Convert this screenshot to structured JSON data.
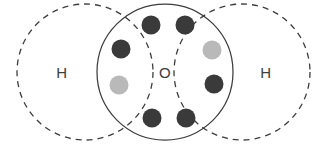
{
  "diagram": {
    "type": "venn-overlap-electron-shell",
    "canvas": {
      "width": 324,
      "height": 144,
      "background": "#ffffff"
    },
    "colors": {
      "outline": "#3d3d3d",
      "electron_dark": "#3a3a3a",
      "electron_light": "#b9b9b9",
      "label": "#3d3d3d",
      "background": "#ffffff"
    },
    "shells": [
      {
        "id": "shell-hydrogen-left",
        "element_label": "H",
        "style": "dashed",
        "cx": 85,
        "cy": 72,
        "r": 68,
        "label_x": 62,
        "label_y": 72
      },
      {
        "id": "shell-oxygen-center",
        "element_label": "O",
        "style": "solid",
        "cx": 165,
        "cy": 72,
        "r": 68,
        "label_x": 165,
        "label_y": 72
      },
      {
        "id": "shell-hydrogen-right",
        "element_label": "H",
        "style": "dashed",
        "cx": 242,
        "cy": 72,
        "r": 68,
        "label_x": 266,
        "label_y": 72
      }
    ],
    "electrons": [
      {
        "id": "electron-top-left",
        "cx": 151,
        "cy": 25,
        "r": 9.5,
        "shade": "dark",
        "shade_hex": "#3a3a3a"
      },
      {
        "id": "electron-top-right",
        "cx": 185,
        "cy": 25,
        "r": 9.5,
        "shade": "dark",
        "shade_hex": "#3a3a3a"
      },
      {
        "id": "electron-upper-left-bond",
        "cx": 121,
        "cy": 49,
        "r": 9.5,
        "shade": "dark",
        "shade_hex": "#3a3a3a"
      },
      {
        "id": "electron-lower-left-bond",
        "cx": 119,
        "cy": 85,
        "r": 9.5,
        "shade": "light",
        "shade_hex": "#b9b9b9"
      },
      {
        "id": "electron-upper-right-bond",
        "cx": 212,
        "cy": 50,
        "r": 9.5,
        "shade": "light",
        "shade_hex": "#b9b9b9"
      },
      {
        "id": "electron-lower-right-bond",
        "cx": 214,
        "cy": 84,
        "r": 9.5,
        "shade": "dark",
        "shade_hex": "#3a3a3a"
      },
      {
        "id": "electron-bottom-left",
        "cx": 152,
        "cy": 118,
        "r": 9.5,
        "shade": "dark",
        "shade_hex": "#3a3a3a"
      },
      {
        "id": "electron-bottom-right",
        "cx": 186,
        "cy": 118,
        "r": 9.5,
        "shade": "dark",
        "shade_hex": "#3a3a3a"
      }
    ]
  }
}
